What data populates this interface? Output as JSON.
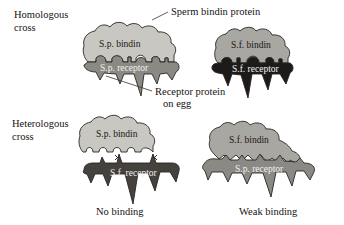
{
  "figure": {
    "rows": [
      {
        "id": "homologous",
        "side_label_line1": "Homologous",
        "side_label_line2": "cross",
        "pairs": [
          {
            "id": "sp-sp",
            "bindin_label": "S.p. bindin",
            "receptor_label": "S.p. receptor",
            "bindin_color": "#c9c7c2",
            "receptor_color": "#8a8984",
            "caption": ""
          },
          {
            "id": "sf-sf",
            "bindin_label": "S.f.  bindin",
            "receptor_label": "S.f.  receptor",
            "bindin_color": "#a9a7a2",
            "receptor_color": "#1d1b19",
            "caption": ""
          }
        ]
      },
      {
        "id": "heterologous",
        "side_label_line1": "Heterologous",
        "side_label_line2": "cross",
        "pairs": [
          {
            "id": "sp-sf",
            "bindin_label": "S.p. bindin",
            "receptor_label": "S.f.  receptor",
            "bindin_color": "#c9c7c2",
            "receptor_color": "#45413d",
            "caption": "No binding"
          },
          {
            "id": "sf-sp",
            "bindin_label": "S.f.  bindin",
            "receptor_label": "S.p. receptor",
            "bindin_color": "#a9a7a2",
            "receptor_color": "#8a8984",
            "caption": "Weak binding"
          }
        ]
      }
    ],
    "annotations": [
      {
        "id": "sperm-bindin-protein",
        "text": "Sperm bindin protein"
      },
      {
        "id": "receptor-protein-on-egg-line1",
        "text": "Receptor protein"
      },
      {
        "id": "receptor-protein-on-egg-line2",
        "text": "on egg"
      }
    ],
    "mismatch_marks": {
      "symbol": "×",
      "count": 2
    },
    "colors": {
      "background": "#ffffff",
      "ink": "#16120f",
      "outline": "#2a2522",
      "bindin_light": "#c9c7c2",
      "bindin_mid": "#a9a7a2",
      "receptor_mid": "#8a8984",
      "receptor_dark": "#45413d",
      "receptor_black": "#1d1b19",
      "white_text": "#f2f0ec"
    }
  }
}
